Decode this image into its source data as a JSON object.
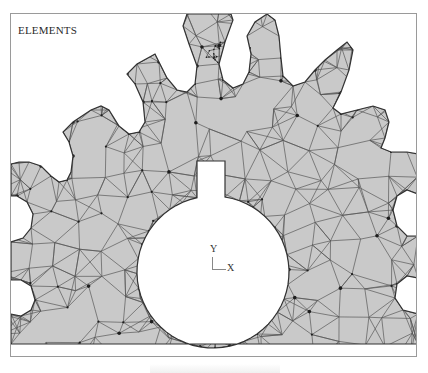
{
  "figure": {
    "plot_label": "ELEMENTS",
    "axis_triad": {
      "y_label": "Y",
      "x_label": "X"
    },
    "colors": {
      "background": "#ffffff",
      "frame_border": "#9a9a9a",
      "element_fill": "#c9c9c9",
      "mesh_line": "#555555",
      "node_dot": "#1e1e1e"
    },
    "features": {
      "teeth_visible": 8,
      "bore": "circular bore with rectangular keyway at top",
      "mesh_refinement": "dense refinement at root of tooth near top center"
    }
  }
}
